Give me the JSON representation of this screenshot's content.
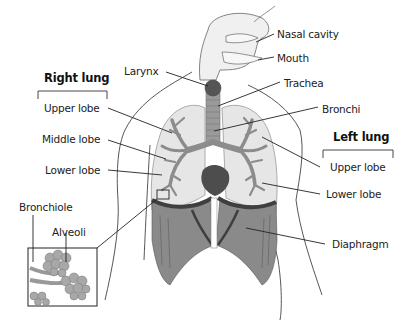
{
  "diagram": {
    "groups": {
      "right_lung": {
        "heading": "Right lung",
        "lobes": [
          "Upper lobe",
          "Middle lobe",
          "Lower lobe"
        ]
      },
      "left_lung": {
        "heading": "Left lung",
        "lobes": [
          "Upper lobe",
          "Lower lobe"
        ]
      }
    },
    "labels": {
      "nasal_cavity": "Nasal cavity",
      "mouth": "Mouth",
      "larynx": "Larynx",
      "trachea": "Trachea",
      "bronchi": "Bronchi",
      "right_upper_lobe": "Upper lobe",
      "right_middle_lobe": "Middle lobe",
      "right_lower_lobe": "Lower lobe",
      "left_upper_lobe": "Upper lobe",
      "left_lower_lobe": "Lower lobe",
      "diaphragm": "Diaphragm",
      "bronchiole": "Bronchiole",
      "alveoli": "Alveoli"
    },
    "colors": {
      "lung_fill": "#e6e6e6",
      "bronchi_fill": "#8c8c8c",
      "larynx_fill": "#555555",
      "trachea_fill": "#9a9a9a",
      "diaphragm_fill": "#8a8a8a",
      "diaphragm_dark": "#3f3f3f",
      "heart_fill": "#4d4d4d",
      "outline": "#333333",
      "leader_line": "#222222"
    }
  }
}
